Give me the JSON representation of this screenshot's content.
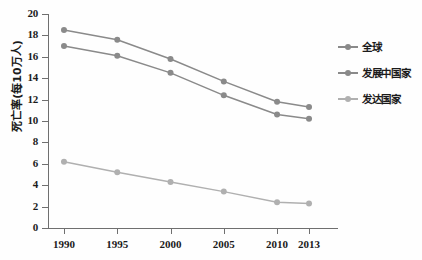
{
  "chart_data": {
    "type": "line",
    "title": "",
    "subtitle": "",
    "xlabel": "",
    "ylabel": "死亡率(每10万人)",
    "categories": [
      "1990",
      "1995",
      "2000",
      "2005",
      "2010",
      "2013"
    ],
    "x": [
      1990,
      1995,
      2000,
      2005,
      2010,
      2013
    ],
    "xlim": [
      1988.5,
      2014.5
    ],
    "ylim": [
      0,
      20
    ],
    "yticks": [
      0,
      2,
      4,
      6,
      8,
      10,
      12,
      14,
      16,
      18,
      20
    ],
    "grid": false,
    "legend_position": "right",
    "series": [
      {
        "name": "全球",
        "values": [
          18.5,
          17.6,
          15.8,
          13.7,
          11.8,
          11.3
        ],
        "color": "#8a8a8a"
      },
      {
        "name": "发展中国家",
        "values": [
          17.0,
          16.1,
          14.5,
          12.4,
          10.6,
          10.2
        ],
        "color": "#8a8a8a"
      },
      {
        "name": "发达国家",
        "values": [
          6.2,
          5.2,
          4.3,
          3.4,
          2.4,
          2.3
        ],
        "color": "#b0b0b0"
      }
    ]
  },
  "axes": {
    "y_title": "死亡率(每10万人)",
    "y_tick_labels": [
      "20",
      "18",
      "16",
      "14",
      "12",
      "10",
      "8",
      "6",
      "4",
      "2",
      "0"
    ],
    "x_tick_labels": [
      "1990",
      "1995",
      "2000",
      "2005",
      "2010",
      "2013"
    ]
  },
  "legend": {
    "items": [
      {
        "label": "全球",
        "color": "#8a8a8a"
      },
      {
        "label": "发展中国家",
        "color": "#8a8a8a"
      },
      {
        "label": "发达国家",
        "color": "#b0b0b0"
      }
    ]
  },
  "colors": {
    "axis": "#6f6f6f",
    "text": "#1b1b1b",
    "background": "#fefefe",
    "series_dark": "#8a8a8a",
    "series_light": "#b0b0b0"
  }
}
